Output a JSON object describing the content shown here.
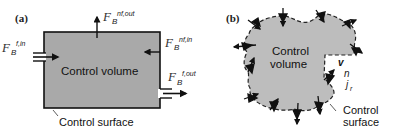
{
  "panel_a": {
    "label": "(a)",
    "volume_label": "Control volume",
    "surface_label": "Control surface",
    "fluxes": {
      "f_in": {
        "symbol": "F",
        "sub": "B",
        "sup": "f,in"
      },
      "nf_out": {
        "symbol": "F",
        "sub": "B",
        "sup": "nf,out"
      },
      "nf_in": {
        "symbol": "F",
        "sub": "B",
        "sup": "nf,in"
      },
      "f_out": {
        "symbol": "F",
        "sub": "B",
        "sup": "f,out"
      }
    }
  },
  "panel_b": {
    "label": "(b)",
    "volume_label_1": "Control",
    "volume_label_2": "volume",
    "surface_label_1": "Control",
    "surface_label_2": "surface",
    "vectors": {
      "v": "v",
      "n": "n",
      "j": "j",
      "j_sub": "r"
    }
  },
  "colors": {
    "fill": "#a9a9a9",
    "stroke": "#111111",
    "blob_fill": "#bdbdbd"
  }
}
